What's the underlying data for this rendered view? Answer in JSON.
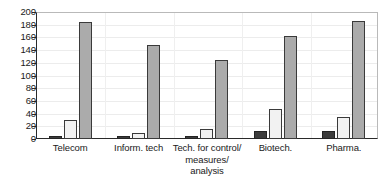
{
  "chart_data": {
    "type": "bar",
    "title": "",
    "subtitle": "",
    "xlabel": "",
    "ylabel": "",
    "ylim": [
      0,
      200
    ],
    "yticks": [
      0,
      20,
      40,
      60,
      80,
      100,
      120,
      140,
      160,
      180,
      200
    ],
    "grid": true,
    "legend": "none",
    "categories": [
      "Telecom",
      "Inform. tech",
      "Tech. for control/\nmeasures/\nanalysis",
      "Biotech.",
      "Pharma."
    ],
    "series": [
      {
        "name": "series-1",
        "color": "#3c3c3c",
        "values": [
          5,
          5,
          5,
          13,
          13
        ]
      },
      {
        "name": "series-2",
        "color": "#f2f2f2",
        "values": [
          30,
          10,
          15,
          47,
          35
        ]
      },
      {
        "name": "series-3",
        "color": "#ababab",
        "values": [
          184,
          148,
          124,
          162,
          186
        ]
      }
    ]
  },
  "axis": {
    "y_tick_labels": [
      "200",
      "180",
      "160",
      "140",
      "120",
      "100",
      "80",
      "60",
      "40",
      "20",
      "0"
    ]
  }
}
